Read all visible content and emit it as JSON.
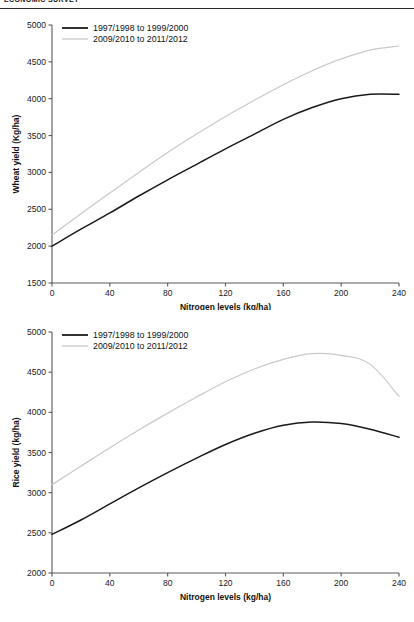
{
  "header": {
    "running_head": "ECONOMIC SURVEY"
  },
  "charts": [
    {
      "id": "wheat",
      "ylabel": "Wheat yield (Kg/ha)",
      "xlabel": "Nitrogen levels (kg/ha)",
      "yticks": [
        "1500",
        "2000",
        "2500",
        "3000",
        "3500",
        "4000",
        "4500",
        "5000"
      ],
      "xticks": [
        "0",
        "40",
        "80",
        "120",
        "160",
        "200",
        "240"
      ],
      "legend": [
        {
          "label": "1997/1998 to 1999/2000",
          "color": "#1a1a1a"
        },
        {
          "label": "2009/2010 to 2011/2012",
          "color": "#c9c9c9"
        }
      ]
    },
    {
      "id": "rice",
      "ylabel": "Rice yield (kg/ha)",
      "xlabel": "Nitrogen levels (kg/ha)",
      "yticks": [
        "2000",
        "2500",
        "3000",
        "3500",
        "4000",
        "4500",
        "5000"
      ],
      "xticks": [
        "0",
        "40",
        "80",
        "120",
        "160",
        "200",
        "240"
      ],
      "legend": [
        {
          "label": "1997/1998 to 1999/2000",
          "color": "#1a1a1a"
        },
        {
          "label": "2009/2010 to 2011/2012",
          "color": "#c9c9c9"
        }
      ]
    }
  ],
  "chart_data": [
    {
      "type": "line",
      "id": "wheat",
      "title": "",
      "xlabel": "Nitrogen levels (kg/ha)",
      "ylabel": "Wheat yield (Kg/ha)",
      "xlim": [
        0,
        240
      ],
      "ylim": [
        1500,
        5000
      ],
      "xticks": [
        0,
        40,
        80,
        120,
        160,
        200,
        240
      ],
      "yticks": [
        1500,
        2000,
        2500,
        3000,
        3500,
        4000,
        4500,
        5000
      ],
      "grid": false,
      "legend_position": "top-left",
      "x": [
        0,
        20,
        40,
        60,
        80,
        100,
        120,
        140,
        160,
        180,
        200,
        220,
        240
      ],
      "series": [
        {
          "name": "1997/1998 to 1999/2000",
          "color": "#1a1a1a",
          "values": [
            2000,
            2230,
            2450,
            2680,
            2900,
            3110,
            3320,
            3520,
            3720,
            3880,
            4000,
            4060,
            4060
          ]
        },
        {
          "name": "2009/2010 to 2011/2012",
          "color": "#c9c9c9",
          "values": [
            2150,
            2440,
            2720,
            3000,
            3270,
            3520,
            3760,
            3980,
            4190,
            4380,
            4540,
            4660,
            4715
          ]
        }
      ]
    },
    {
      "type": "line",
      "id": "rice",
      "title": "",
      "xlabel": "Nitrogen levels (kg/ha)",
      "ylabel": "Rice yield (kg/ha)",
      "xlim": [
        0,
        240
      ],
      "ylim": [
        2000,
        5000
      ],
      "xticks": [
        0,
        40,
        80,
        120,
        160,
        200,
        240
      ],
      "yticks": [
        2000,
        2500,
        3000,
        3500,
        4000,
        4500,
        5000
      ],
      "grid": false,
      "legend_position": "top-left",
      "x": [
        0,
        20,
        40,
        60,
        80,
        100,
        120,
        140,
        160,
        180,
        200,
        220,
        240
      ],
      "series": [
        {
          "name": "1997/1998 to 1999/2000",
          "color": "#1a1a1a",
          "values": [
            2480,
            2660,
            2860,
            3060,
            3250,
            3430,
            3600,
            3740,
            3840,
            3880,
            3860,
            3790,
            3690
          ]
        },
        {
          "name": "2009/2010 to 2011/2012",
          "color": "#c9c9c9",
          "values": [
            3100,
            3330,
            3560,
            3780,
            3990,
            4190,
            4380,
            4540,
            4660,
            4730,
            4710,
            4600,
            4200
          ]
        }
      ]
    }
  ]
}
